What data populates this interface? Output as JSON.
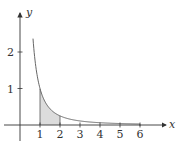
{
  "chart_data": {
    "type": "line",
    "title": "",
    "function": "y = 1/x^2",
    "xlabel": "x",
    "ylabel": "y",
    "xlim": [
      0,
      6
    ],
    "ylim": [
      0,
      2.4
    ],
    "x_ticks": [
      "1",
      "2",
      "3",
      "4",
      "5",
      "6"
    ],
    "y_ticks": [
      "1",
      "2"
    ],
    "grid": false,
    "shaded_region": {
      "from": 1,
      "to": 2,
      "description": "area under curve between x=1 and x=2"
    },
    "series": [
      {
        "name": "curve",
        "x": [
          0.65,
          0.8,
          1,
          1.5,
          2,
          3,
          4,
          5,
          6
        ],
        "values": [
          2.37,
          1.56,
          1.0,
          0.44,
          0.25,
          0.11,
          0.06,
          0.04,
          0.03
        ]
      }
    ],
    "colors": {
      "curve": "#555555",
      "shade": "#dcdcdc",
      "axis": "#333333"
    }
  }
}
